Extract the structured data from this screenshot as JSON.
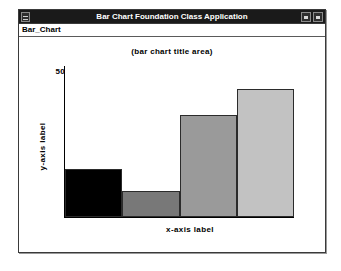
{
  "window": {
    "title": "Bar Chart Foundation Class Application",
    "sysmenu_icon": "system-menu-icon",
    "buttons": [
      {
        "name": "minimize-button",
        "glyph": "minimize-icon"
      },
      {
        "name": "maximize-button",
        "glyph": "maximize-icon"
      }
    ]
  },
  "menubar": {
    "items": [
      {
        "label": "Bar_Chart"
      }
    ]
  },
  "chart_data": {
    "type": "bar",
    "title": "(bar chart title area)",
    "xlabel": "x-axis label",
    "ylabel": "y-axis label",
    "categories": [
      "",
      "",
      "",
      ""
    ],
    "values": [
      15,
      8,
      32,
      40
    ],
    "ylim": [
      0,
      50
    ],
    "yticks": [
      50
    ],
    "ytick_labels": [
      "50"
    ],
    "grid": false,
    "legend": "none",
    "bar_colors": [
      "#000000",
      "#787878",
      "#9a9a9a",
      "#c2c2c2"
    ],
    "bar_border_color": "#2b2b2b"
  },
  "colors": {
    "titlebar_bg": "#1a1a1a",
    "titlebar_fg": "#ffffff",
    "window_bg": "#ffffff",
    "frame_border": "#3a3a3a",
    "axis": "#000000"
  }
}
